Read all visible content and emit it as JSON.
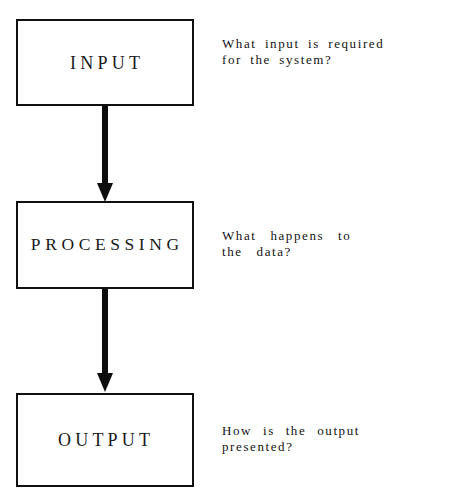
{
  "diagram": {
    "background_color": "#ffffff",
    "stroke_color": "#101010",
    "text_color": "#121212",
    "nodes": [
      {
        "id": "input",
        "label": "INPUT",
        "annotation_lines": [
          "What input is required",
          "for the system?"
        ]
      },
      {
        "id": "processing",
        "label": "PROCESSING",
        "annotation_lines": [
          "What happens to",
          "the data?"
        ]
      },
      {
        "id": "output",
        "label": "OUTPUT",
        "annotation_lines": [
          "How is the output",
          "presented?"
        ]
      }
    ],
    "connectors": [
      {
        "id": "input-to-processing",
        "from": "input",
        "to": "processing",
        "style": "solid-thick-down-arrow"
      },
      {
        "id": "processing-to-output",
        "from": "processing",
        "to": "output",
        "style": "solid-thick-down-arrow"
      }
    ]
  }
}
